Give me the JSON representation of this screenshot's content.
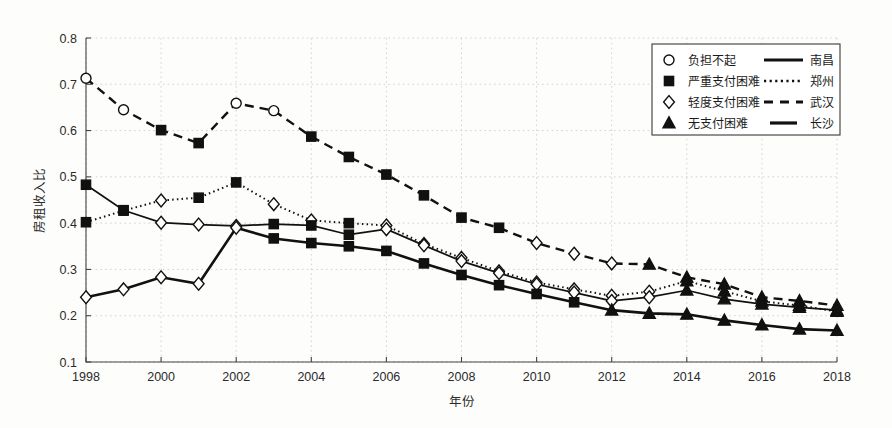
{
  "chart_data": {
    "type": "line",
    "title": "",
    "xlabel": "年份",
    "ylabel": "房租收入比",
    "xlim": [
      1998,
      2018
    ],
    "ylim": [
      0.1,
      0.8
    ],
    "ytick_labels": [
      "0.1",
      "0.2",
      "0.3",
      "0.4",
      "0.5",
      "0.6",
      "0.7",
      "0.8"
    ],
    "ytick_values": [
      0.1,
      0.2,
      0.3,
      0.4,
      0.5,
      0.6,
      0.7,
      0.8
    ],
    "xtick_labels": [
      "1998",
      "2000",
      "2002",
      "2004",
      "2006",
      "2008",
      "2010",
      "2012",
      "2014",
      "2016",
      "2018"
    ],
    "xtick_values": [
      1998,
      2000,
      2002,
      2004,
      2006,
      2008,
      2010,
      2012,
      2014,
      2016,
      2018
    ],
    "x": [
      1998,
      1999,
      2000,
      2001,
      2002,
      2003,
      2004,
      2005,
      2006,
      2007,
      2008,
      2009,
      2010,
      2011,
      2012,
      2013,
      2014,
      2015,
      2016,
      2017,
      2018
    ],
    "grid": true,
    "legend_position": "top-right",
    "series": [
      {
        "name": "武汉",
        "line_style": "dashed",
        "values": [
          0.713,
          0.645,
          0.601,
          0.573,
          0.659,
          0.643,
          0.587,
          0.543,
          0.505,
          0.46,
          0.412,
          0.39,
          0.357,
          0.334,
          0.313,
          0.311,
          0.283,
          0.268,
          0.24,
          0.232,
          0.222
        ],
        "markers": [
          "circle",
          "circle",
          "square",
          "square",
          "circle",
          "circle",
          "square",
          "square",
          "square",
          "square",
          "square",
          "square",
          "diamond",
          "diamond",
          "diamond",
          "triangle",
          "triangle",
          "triangle",
          "triangle",
          "triangle",
          "triangle"
        ]
      },
      {
        "name": "郑州",
        "line_style": "dotted",
        "values": [
          0.402,
          0.427,
          0.449,
          0.455,
          0.488,
          0.441,
          0.406,
          0.4,
          0.395,
          0.355,
          0.325,
          0.296,
          0.272,
          0.257,
          0.243,
          0.252,
          0.275,
          0.253,
          0.231,
          0.222,
          0.209
        ],
        "markers": [
          "square",
          "square",
          "diamond",
          "square",
          "square",
          "diamond",
          "diamond",
          "square",
          "diamond",
          "diamond",
          "diamond",
          "diamond",
          "diamond",
          "diamond",
          "diamond",
          "diamond",
          "triangle",
          "triangle",
          "triangle",
          "triangle",
          "triangle"
        ]
      },
      {
        "name": "南昌",
        "line_style": "solid",
        "values": [
          0.483,
          0.428,
          0.401,
          0.397,
          0.394,
          0.398,
          0.395,
          0.375,
          0.387,
          0.352,
          0.318,
          0.292,
          0.268,
          0.25,
          0.232,
          0.24,
          0.255,
          0.236,
          0.225,
          0.218,
          0.212
        ],
        "markers": [
          "square",
          "square",
          "diamond",
          "diamond",
          "diamond",
          "square",
          "square",
          "square",
          "diamond",
          "diamond",
          "diamond",
          "diamond",
          "diamond",
          "diamond",
          "diamond",
          "diamond",
          "triangle",
          "triangle",
          "triangle",
          "triangle",
          "triangle"
        ]
      },
      {
        "name": "长沙",
        "line_style": "solid-thick",
        "values": [
          0.24,
          0.257,
          0.283,
          0.269,
          0.39,
          0.367,
          0.357,
          0.35,
          0.34,
          0.313,
          0.288,
          0.266,
          0.247,
          0.229,
          0.212,
          0.205,
          0.203,
          0.19,
          0.18,
          0.171,
          0.168
        ],
        "markers": [
          "diamond",
          "diamond",
          "diamond",
          "diamond",
          "diamond",
          "square",
          "square",
          "square",
          "square",
          "square",
          "square",
          "square",
          "square",
          "square",
          "triangle",
          "triangle",
          "triangle",
          "triangle",
          "triangle",
          "triangle",
          "triangle"
        ]
      }
    ],
    "legend": {
      "marker_entries": [
        {
          "marker": "circle",
          "label": "负担不起"
        },
        {
          "marker": "square",
          "label": "严重支付困难"
        },
        {
          "marker": "diamond",
          "label": "轻度支付困难"
        },
        {
          "marker": "triangle",
          "label": "无支付困难"
        }
      ],
      "line_entries": [
        {
          "style": "solid",
          "label": "南昌"
        },
        {
          "style": "dotted",
          "label": "郑州"
        },
        {
          "style": "dashed",
          "label": "武汉"
        },
        {
          "style": "solid-thick",
          "label": "长沙"
        }
      ]
    },
    "colors": {
      "ink": "#111111",
      "grid": "#c9c9c9",
      "background": "#fdfdfb"
    }
  }
}
